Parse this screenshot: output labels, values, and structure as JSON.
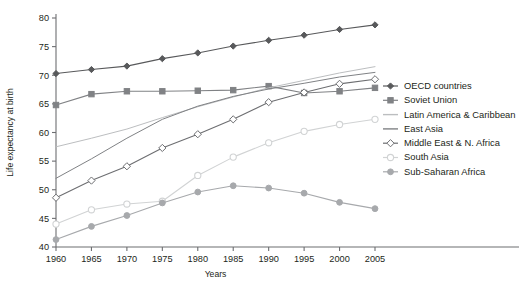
{
  "chart_data": {
    "type": "line",
    "title": "",
    "xlabel": "Years",
    "ylabel": "Life expectancy at birth",
    "x": [
      1960,
      1965,
      1970,
      1975,
      1980,
      1985,
      1990,
      1995,
      2000,
      2005
    ],
    "xtick_labels": [
      "1960",
      "1965",
      "1970",
      "1975",
      "1980",
      "1985",
      "1990",
      "1995",
      "2000",
      "2005"
    ],
    "ytick_labels": [
      "40",
      "45",
      "50",
      "55",
      "60",
      "65",
      "70",
      "75",
      "80"
    ],
    "yticks": [
      40,
      45,
      50,
      55,
      60,
      65,
      70,
      75,
      80
    ],
    "xlim": [
      1960,
      2005
    ],
    "ylim": [
      40,
      80
    ],
    "grid": false,
    "legend_position": "right",
    "series": [
      {
        "name": "OECD countries",
        "color": "#58595b",
        "marker": "filled-diamond",
        "values": [
          70.3,
          71.0,
          71.6,
          72.9,
          73.9,
          75.1,
          76.1,
          77.0,
          78.0,
          78.8
        ]
      },
      {
        "name": "Soviet Union",
        "color": "#808285",
        "marker": "filled-square",
        "values": [
          64.8,
          66.7,
          67.2,
          67.2,
          67.3,
          67.4,
          68.1,
          66.9,
          67.2,
          67.8
        ]
      },
      {
        "name": "Latin America & Caribbean",
        "color": "#bcbec0",
        "marker": "none",
        "values": [
          57.5,
          59.0,
          60.6,
          62.6,
          64.5,
          66.2,
          67.8,
          69.1,
          70.4,
          71.5
        ]
      },
      {
        "name": "East Asia",
        "color": "#808285",
        "marker": "none",
        "values": [
          52.0,
          55.4,
          59.0,
          62.3,
          64.6,
          66.3,
          67.6,
          68.6,
          69.7,
          70.5
        ]
      },
      {
        "name": "Middle East & N. Africa",
        "color": "#6d6e71",
        "marker": "open-diamond",
        "values": [
          48.6,
          51.6,
          54.1,
          57.3,
          59.7,
          62.3,
          65.3,
          67.0,
          68.5,
          69.3
        ]
      },
      {
        "name": "South Asia",
        "color": "#d1d3d4",
        "marker": "open-circle",
        "values": [
          44.0,
          46.5,
          47.5,
          48.0,
          52.5,
          55.7,
          58.2,
          60.2,
          61.4,
          62.3
        ]
      },
      {
        "name": "Sub-Saharan Africa",
        "color": "#a7a9ac",
        "marker": "filled-circle",
        "values": [
          41.3,
          43.6,
          45.5,
          47.7,
          49.6,
          50.7,
          50.3,
          49.4,
          47.8,
          46.7
        ]
      }
    ]
  },
  "legend": {
    "items": [
      {
        "label": "OECD countries"
      },
      {
        "label": "Soviet Union"
      },
      {
        "label": "Latin America & Caribbean"
      },
      {
        "label": "East Asia"
      },
      {
        "label": "Middle East & N. Africa"
      },
      {
        "label": "South Asia"
      },
      {
        "label": "Sub-Saharan Africa"
      }
    ]
  }
}
